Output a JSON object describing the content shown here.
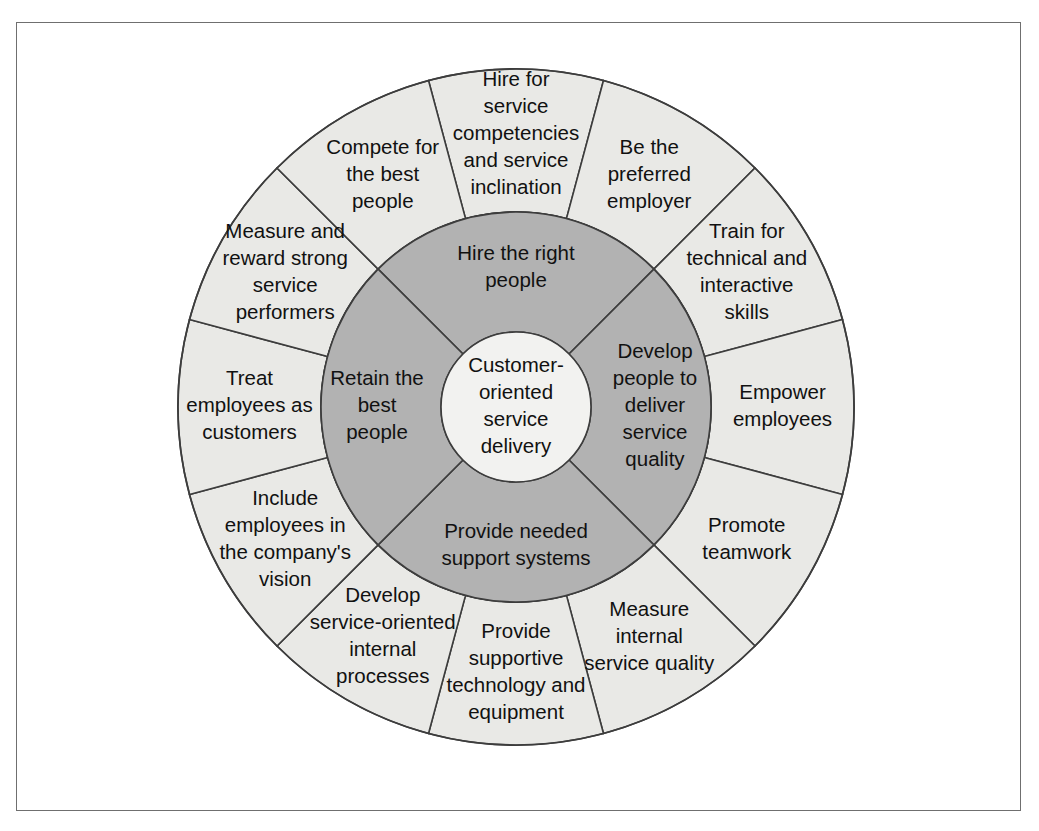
{
  "figure": {
    "colors": {
      "outer_ring_fill": "#e9e9e6",
      "inner_ring_fill": "#b2b2b2",
      "hub_fill": "#f2f2f0",
      "stroke": "#3d3d3d",
      "frame_border": "#6f6f6f",
      "page_background": "#ffffff",
      "text": "#111111"
    },
    "geometry": {
      "center_x": 516,
      "center_y": 407,
      "outer_radius": 338,
      "inner_ring_radius": 195,
      "hub_radius": 75,
      "outer_segment_count": 12,
      "inner_segment_count": 4,
      "segment_span_degrees": 30
    }
  },
  "hub": {
    "label": "Customer-oriented service delivery",
    "lines": [
      "Customer-",
      "oriented",
      "service",
      "delivery"
    ]
  },
  "inner_ring": {
    "segments": [
      {
        "id": "hire-the-right-people",
        "label": "Hire the right people",
        "lines": [
          "Hire the right",
          "people"
        ],
        "start_angle": -135,
        "end_angle": -45,
        "label_angle": -90
      },
      {
        "id": "develop-people-to-deliver-service-quality",
        "label": "Develop people to deliver service quality",
        "lines": [
          "Develop",
          "people to",
          "deliver",
          "service",
          "quality"
        ],
        "start_angle": -45,
        "end_angle": 45,
        "label_angle": 0
      },
      {
        "id": "provide-needed-support-systems",
        "label": "Provide needed support systems",
        "lines": [
          "Provide needed",
          "support systems"
        ],
        "start_angle": 45,
        "end_angle": 135,
        "label_angle": 90
      },
      {
        "id": "retain-the-best-people",
        "label": "Retain the best people",
        "lines": [
          "Retain the",
          "best",
          "people"
        ],
        "start_angle": 135,
        "end_angle": 225,
        "label_angle": 180
      }
    ]
  },
  "outer_ring": {
    "segments": [
      {
        "id": "hire-for-service-competencies-and-service-inclination",
        "label": "Hire for service competencies and service inclination",
        "lines": [
          "Hire for",
          "service",
          "competencies",
          "and service",
          "inclination"
        ],
        "start_angle": -105,
        "end_angle": -75,
        "label_angle": -90,
        "parent": "hire-the-right-people"
      },
      {
        "id": "be-the-preferred-employer",
        "label": "Be the preferred employer",
        "lines": [
          "Be the",
          "preferred",
          "employer"
        ],
        "start_angle": -75,
        "end_angle": -45,
        "label_angle": -60,
        "parent": "hire-the-right-people"
      },
      {
        "id": "train-for-technical-and-interactive-skills",
        "label": "Train for technical and interactive skills",
        "lines": [
          "Train for",
          "technical and",
          "interactive",
          "skills"
        ],
        "start_angle": -45,
        "end_angle": -15,
        "label_angle": -30,
        "parent": "develop-people-to-deliver-service-quality"
      },
      {
        "id": "empower-employees",
        "label": "Empower employees",
        "lines": [
          "Empower",
          "employees"
        ],
        "start_angle": -15,
        "end_angle": 15,
        "label_angle": 0,
        "parent": "develop-people-to-deliver-service-quality"
      },
      {
        "id": "promote-teamwork",
        "label": "Promote teamwork",
        "lines": [
          "Promote",
          "teamwork"
        ],
        "start_angle": 15,
        "end_angle": 45,
        "label_angle": 30,
        "parent": "develop-people-to-deliver-service-quality"
      },
      {
        "id": "measure-internal-service-quality",
        "label": "Measure internal service quality",
        "lines": [
          "Measure",
          "internal",
          "service quality"
        ],
        "start_angle": 45,
        "end_angle": 75,
        "label_angle": 60,
        "parent": "provide-needed-support-systems"
      },
      {
        "id": "provide-supportive-technology-and-equipment",
        "label": "Provide supportive technology and equipment",
        "lines": [
          "Provide",
          "supportive",
          "technology and",
          "equipment"
        ],
        "start_angle": 75,
        "end_angle": 105,
        "label_angle": 90,
        "parent": "provide-needed-support-systems"
      },
      {
        "id": "develop-service-oriented-internal-processes",
        "label": "Develop service-oriented internal processes",
        "lines": [
          "Develop",
          "service-oriented",
          "internal",
          "processes"
        ],
        "start_angle": 105,
        "end_angle": 135,
        "label_angle": 120,
        "parent": "provide-needed-support-systems"
      },
      {
        "id": "include-employees-in-the-companys-vision",
        "label": "Include employees in the company's vision",
        "lines": [
          "Include",
          "employees in",
          "the company's",
          "vision"
        ],
        "start_angle": 135,
        "end_angle": 165,
        "label_angle": 150,
        "parent": "retain-the-best-people"
      },
      {
        "id": "treat-employees-as-customers",
        "label": "Treat employees as customers",
        "lines": [
          "Treat",
          "employees as",
          "customers"
        ],
        "start_angle": 165,
        "end_angle": 195,
        "label_angle": 180,
        "parent": "retain-the-best-people"
      },
      {
        "id": "measure-and-reward-strong-service-performers",
        "label": "Measure and reward strong service performers",
        "lines": [
          "Measure and",
          "reward strong",
          "service",
          "performers"
        ],
        "start_angle": 195,
        "end_angle": 225,
        "label_angle": 210,
        "parent": "retain-the-best-people"
      },
      {
        "id": "compete-for-the-best-people",
        "label": "Compete for the best people",
        "lines": [
          "Compete for",
          "the best",
          "people"
        ],
        "start_angle": 225,
        "end_angle": 255,
        "label_angle": 240,
        "parent": "hire-the-right-people"
      }
    ]
  }
}
